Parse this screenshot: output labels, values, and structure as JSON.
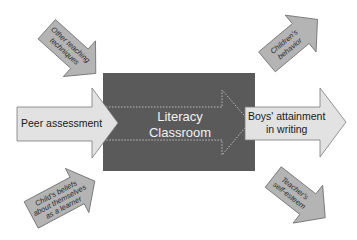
{
  "diagram": {
    "center": {
      "title_line1": "Literacy",
      "title_line2": "Classroom"
    },
    "input_arrow": {
      "label": "Peer assessment"
    },
    "output_arrow": {
      "label_line1": "Boys' attainment",
      "label_line2": "in writing"
    },
    "influences": [
      {
        "id": "other-teaching",
        "lines": [
          "Other teaching",
          "techniques"
        ],
        "direction": "inward"
      },
      {
        "id": "childs-beliefs",
        "lines": [
          "Child's beliefs",
          "about themselves",
          "as a learner"
        ],
        "direction": "inward"
      },
      {
        "id": "childrens-behavior",
        "lines": [
          "Children's",
          "behavior"
        ],
        "direction": "outward"
      },
      {
        "id": "teachers-self-esteem",
        "lines": [
          "Teacher's",
          "self-esteem"
        ],
        "direction": "outward"
      }
    ],
    "colors": {
      "center_box": "#5a5a5a",
      "big_arrow_fill": "#e2e2e2",
      "small_arrow_fill": "#b4b4b4",
      "stroke": "#6e6e6e",
      "dotted_outline": "#bdbdbd"
    }
  }
}
